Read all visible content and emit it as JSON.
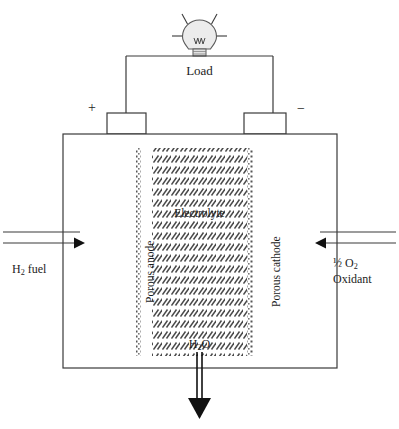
{
  "diagram": {
    "circuit": {
      "load_label": "Load",
      "bulb_icon": "light-bulb-icon",
      "positive_sign": "+",
      "negative_sign": "−"
    },
    "cell": {
      "anode_label": "Porous anode",
      "cathode_label": "Porous cathode",
      "electrolyte_label": "Electrolyte",
      "product_label": "H₂O",
      "product_label_base": "H",
      "product_label_sub": "2",
      "product_label_tail": "O"
    },
    "inlets": {
      "fuel_base": "H",
      "fuel_sub": "2",
      "fuel_tail": " fuel",
      "fuel_label": "H₂ fuel",
      "oxidant_amount": "½ O₂",
      "oxidant_amount_prefix": "½ O",
      "oxidant_amount_sub": "2",
      "oxidant_label": "Oxidant"
    },
    "colors": {
      "line": "#3a3a3a",
      "hatch": "#4a4a4a",
      "dotted": "#555555",
      "bulb_fill": "#ececec",
      "arrow_fill": "#111111",
      "background": "#ffffff"
    }
  }
}
